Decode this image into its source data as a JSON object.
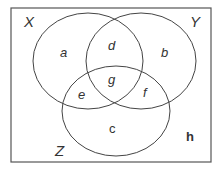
{
  "diagram": {
    "type": "venn",
    "sets": {
      "X": "X",
      "Y": "Y",
      "Z": "Z"
    },
    "regions": {
      "a": "a",
      "b": "b",
      "c": "c",
      "d": "d",
      "e": "e",
      "f": "f",
      "g": "g",
      "h": "h"
    },
    "colors": {
      "stroke": "#444444",
      "text": "#333333",
      "background": "#ffffff"
    }
  }
}
